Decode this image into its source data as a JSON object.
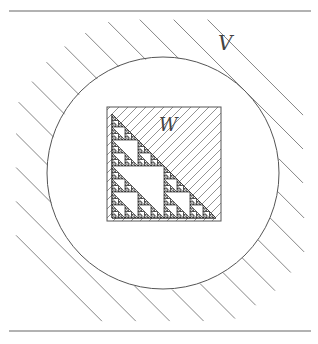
{
  "figure": {
    "labels": {
      "outer_region": "V",
      "inner_region": "W"
    },
    "rules": {
      "top_y": 11,
      "bottom_y": 331,
      "x1": 9,
      "x2": 311
    },
    "circle": {
      "cx": 163,
      "cy": 173,
      "r": 116
    },
    "square": {
      "x": 107,
      "y": 107,
      "size": 114
    },
    "fractal": {
      "type": "sierpinski-triangle",
      "depth": 5
    },
    "colors": {
      "ink": "#555555",
      "dark": "#222222",
      "hatch": "#777777"
    }
  }
}
